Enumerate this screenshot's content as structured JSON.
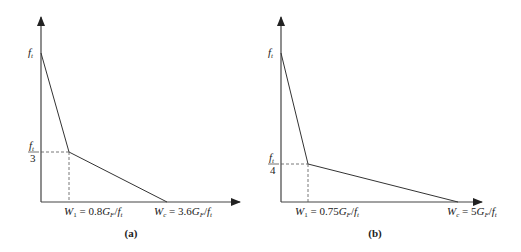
{
  "figure": {
    "panels": [
      {
        "id": "a",
        "caption": "(a)",
        "y_top_label": "f_t",
        "y_knee_label_num": "f_t",
        "y_knee_label_den": "3",
        "x_knee_label": "W_1 = 0.8G_F/f_t",
        "x_end_label": "W_c = 3.6G_F/f_t",
        "points": [
          [
            0,
            1
          ],
          [
            0.8,
            0.3333
          ],
          [
            3.6,
            0
          ]
        ]
      },
      {
        "id": "b",
        "caption": "(b)",
        "y_top_label": "f_t",
        "y_knee_label_num": "f_t",
        "y_knee_label_den": "4",
        "x_knee_label": "W_1 = 0.75G_F/f_t",
        "x_end_label": "W_c = 5G_F/f_t",
        "points": [
          [
            0,
            1
          ],
          [
            0.75,
            0.25
          ],
          [
            5,
            0
          ]
        ]
      }
    ]
  },
  "text": {
    "a": {
      "ft": "f",
      "ft_sub": "t",
      "knee_num": "f",
      "knee_num_sub": "t",
      "knee_den": "3",
      "w1_W": "W",
      "w1_sub": "1",
      "w1_eq": " = 0.8",
      "w1_G": "G",
      "w1_Gsub": "F",
      "w1_slash": "/",
      "w1_f": "f",
      "w1_fsub": "t",
      "wc_W": "W",
      "wc_sub": "c",
      "wc_eq": " = 3.6",
      "wc_G": "G",
      "wc_Gsub": "F",
      "wc_slash": "/",
      "wc_f": "f",
      "wc_fsub": "t",
      "caption": "(a)"
    },
    "b": {
      "ft": "f",
      "ft_sub": "t",
      "knee_num": "f",
      "knee_num_sub": "t",
      "knee_den": "4",
      "w1_W": "W",
      "w1_sub": "1",
      "w1_eq": " = 0.75",
      "w1_G": "G",
      "w1_Gsub": "F",
      "w1_slash": "/",
      "w1_f": "f",
      "w1_fsub": "t",
      "wc_W": "W",
      "wc_sub": "c",
      "wc_eq": " = 5",
      "wc_G": "G",
      "wc_Gsub": "F",
      "wc_slash": "/",
      "wc_f": "f",
      "wc_fsub": "t",
      "caption": "(b)"
    }
  }
}
